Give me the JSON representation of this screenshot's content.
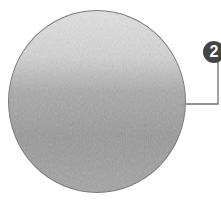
{
  "callout": {
    "number": "2",
    "badge_color": "#444444",
    "line_color": "#6e6e6e"
  },
  "disc": {
    "description": "textured grey circular swatch, lighter at top",
    "colors": {
      "top": "#e2e2e2",
      "bottom": "#989898",
      "border": "#7a7a7a"
    }
  }
}
